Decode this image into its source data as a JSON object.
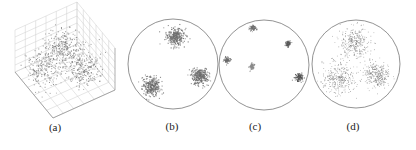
{
  "figure": {
    "panels": [
      {
        "id": "a",
        "label": "(a)",
        "kind": "3d-scatter"
      },
      {
        "id": "b",
        "label": "(b)",
        "kind": "disk-scatter"
      },
      {
        "id": "c",
        "label": "(c)",
        "kind": "disk-scatter"
      },
      {
        "id": "d",
        "label": "(d)",
        "kind": "disk-scatter"
      }
    ]
  },
  "chart_data": [
    {
      "type": "scatter",
      "title": "(a)",
      "projection": "3d",
      "grid": true,
      "point_color": "#777777",
      "grid_color": "#cccccc",
      "clusters": [
        {
          "center": [
            0.5,
            0.5,
            0.8
          ],
          "spread": 0.13,
          "count": 260
        },
        {
          "center": [
            0.2,
            0.55,
            0.45
          ],
          "spread": 0.14,
          "count": 240
        },
        {
          "center": [
            0.65,
            0.25,
            0.45
          ],
          "spread": 0.12,
          "count": 240
        }
      ]
    },
    {
      "type": "scatter",
      "title": "(b)",
      "domain": "unit-disk",
      "point_color": "#6e6e6e",
      "boundary_color": "#777777",
      "clusters": [
        {
          "center": [
            0.05,
            0.6
          ],
          "spread": 0.1,
          "count": 300
        },
        {
          "center": [
            -0.48,
            -0.5
          ],
          "spread": 0.1,
          "count": 300
        },
        {
          "center": [
            0.6,
            -0.28
          ],
          "spread": 0.09,
          "count": 300
        }
      ]
    },
    {
      "type": "scatter",
      "title": "(c)",
      "domain": "unit-disk",
      "point_color": "#666666",
      "boundary_color": "#777777",
      "clusters": [
        {
          "center": [
            -0.25,
            0.82
          ],
          "spread": 0.035,
          "count": 80,
          "shade": "#6f6f6f"
        },
        {
          "center": [
            0.53,
            0.47
          ],
          "spread": 0.03,
          "count": 70,
          "shade": "#555555"
        },
        {
          "center": [
            -0.82,
            0.11
          ],
          "spread": 0.035,
          "count": 80,
          "shade": "#6a6a6a"
        },
        {
          "center": [
            -0.27,
            -0.04
          ],
          "spread": 0.035,
          "count": 80,
          "shade": "#8a8a8a"
        },
        {
          "center": [
            0.78,
            -0.27
          ],
          "spread": 0.045,
          "count": 110,
          "shade": "#4f4f4f"
        }
      ]
    },
    {
      "type": "scatter",
      "title": "(d)",
      "domain": "unit-disk",
      "point_color": "#777777",
      "boundary_color": "#777777",
      "clusters": [
        {
          "center": [
            -0.02,
            0.48
          ],
          "spread": 0.17,
          "count": 320
        },
        {
          "center": [
            -0.4,
            -0.32
          ],
          "spread": 0.18,
          "count": 320
        },
        {
          "center": [
            0.48,
            -0.25
          ],
          "spread": 0.15,
          "count": 320
        }
      ]
    }
  ]
}
